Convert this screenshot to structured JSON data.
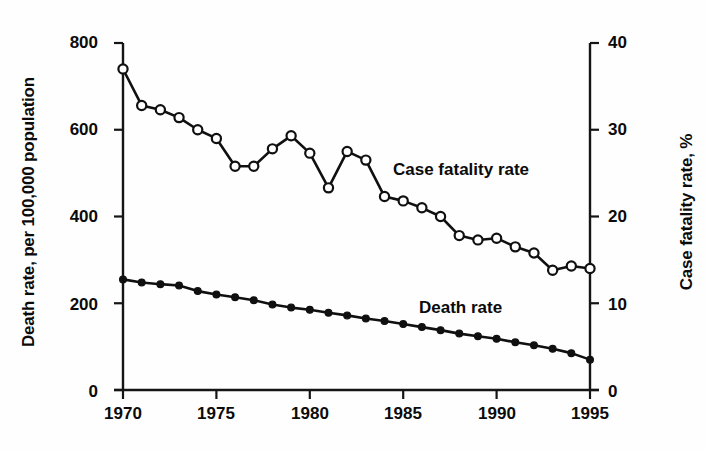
{
  "chart_data": {
    "type": "line",
    "title": "",
    "subtitle": "",
    "xlabel": "",
    "ylabel": "Death rate, per 100,000 population",
    "ylabel_right": "Case fatality rate, %",
    "x": [
      1970,
      1971,
      1972,
      1973,
      1974,
      1975,
      1976,
      1977,
      1978,
      1979,
      1980,
      1981,
      1982,
      1983,
      1984,
      1985,
      1986,
      1987,
      1988,
      1989,
      1990,
      1991,
      1992,
      1993,
      1994,
      1995
    ],
    "xlim": [
      1970,
      1995
    ],
    "ylim": [
      0,
      800
    ],
    "ylim_right": [
      0,
      40
    ],
    "xticks": [
      1970,
      1975,
      1980,
      1985,
      1990,
      1995
    ],
    "xtick_labels": [
      "1970",
      "1975",
      "1980",
      "1985",
      "1990",
      "1995"
    ],
    "yticks_left": [
      0,
      200,
      400,
      600,
      800
    ],
    "ytick_labels_left": [
      "0",
      "200",
      "400",
      "600",
      "800"
    ],
    "yticks_right": [
      0,
      10,
      20,
      30,
      40
    ],
    "ytick_labels_right": [
      "0",
      "10",
      "20",
      "30",
      "40"
    ],
    "grid": false,
    "legend": "inline-annotations",
    "series": [
      {
        "name": "Case fatality rate",
        "axis": "right",
        "unit": "%",
        "marker": "open-circle",
        "label_position": "inside-upper-right",
        "values": [
          37.0,
          32.8,
          32.3,
          31.4,
          30.0,
          29.0,
          25.8,
          25.8,
          27.8,
          29.3,
          27.3,
          23.3,
          27.5,
          26.5,
          22.3,
          21.8,
          21.0,
          20.0,
          17.8,
          17.3,
          17.5,
          16.5,
          15.8,
          13.8,
          14.3,
          14.0
        ]
      },
      {
        "name": "Death rate",
        "axis": "left",
        "unit": "per 100,000 population",
        "marker": "filled-circle",
        "label_position": "inside-lower-right",
        "values": [
          255,
          248,
          244,
          241,
          228,
          220,
          214,
          207,
          197,
          190,
          185,
          178,
          172,
          165,
          159,
          152,
          145,
          138,
          130,
          124,
          118,
          110,
          103,
          95,
          85,
          70
        ]
      }
    ]
  },
  "figure": {
    "axis_title_left": "Death rate, per 100,000 population",
    "axis_title_right": "Case fatality rate, %",
    "annotation_case_fatality": "Case fatality rate",
    "annotation_death_rate": "Death rate"
  }
}
